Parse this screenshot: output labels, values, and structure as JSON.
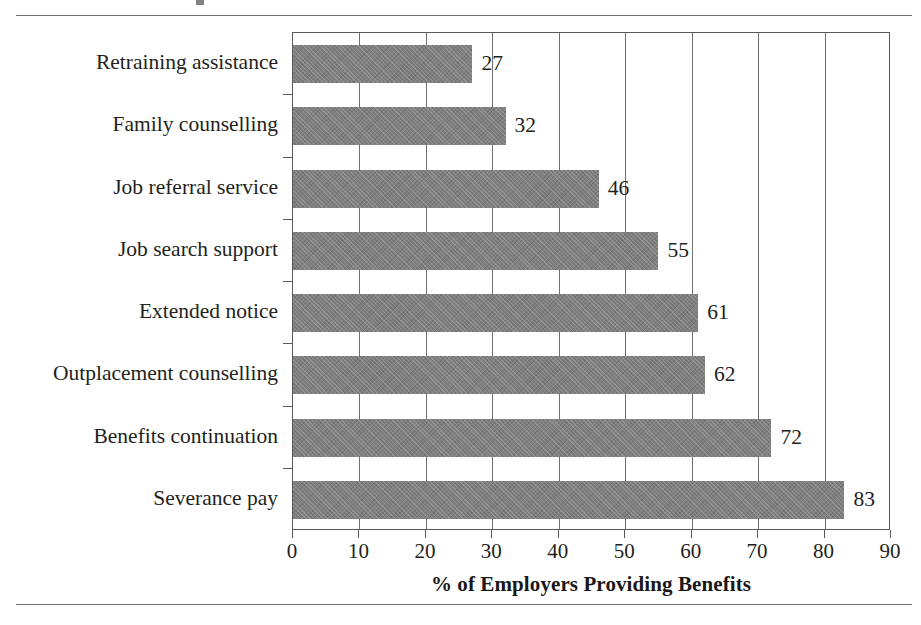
{
  "figure": {
    "has_top_rule": true,
    "has_bottom_rule": true,
    "cropped_title_fragment": ""
  },
  "chart_data": {
    "type": "bar",
    "orientation": "horizontal",
    "title": "",
    "xlabel": "% of Employers Providing Benefits",
    "ylabel": "",
    "categories": [
      "Retraining assistance",
      "Family counselling",
      "Job referral service",
      "Job search support",
      "Extended notice",
      "Outplacement counselling",
      "Benefits continuation",
      "Severance pay"
    ],
    "values": [
      27,
      32,
      46,
      55,
      61,
      62,
      72,
      83
    ],
    "data_labels": [
      "27",
      "32",
      "46",
      "55",
      "61",
      "62",
      "72",
      "83"
    ],
    "xlim": [
      0,
      90
    ],
    "xticks": [
      0,
      10,
      20,
      30,
      40,
      50,
      60,
      70,
      80,
      90
    ],
    "xtick_labels": [
      "0",
      "10",
      "20",
      "30",
      "40",
      "50",
      "60",
      "70",
      "80",
      "90"
    ],
    "grid": "vertical",
    "legend": null,
    "bar_color": "#807f7f",
    "frame_color": "#57595b",
    "text_color": "#231f20"
  }
}
